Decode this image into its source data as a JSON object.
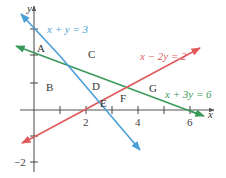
{
  "diagram": {
    "axes": {
      "x_label": "x",
      "y_label": "y",
      "x_tick_labels": [
        "2",
        "4",
        "6"
      ],
      "y_tick_labels": [
        "−2"
      ]
    },
    "lines": [
      {
        "id": "blue",
        "equation": "x + y = 3",
        "color": "#4a9fd8"
      },
      {
        "id": "red",
        "equation": "x − 2y = 2",
        "color": "#e05a5a"
      },
      {
        "id": "green",
        "equation": "x + 3y = 6",
        "color": "#3a9a5a"
      }
    ],
    "regions": [
      "A",
      "B",
      "C",
      "D",
      "E",
      "F",
      "G"
    ],
    "colors": {
      "axis": "#555555",
      "text": "#333333"
    }
  }
}
